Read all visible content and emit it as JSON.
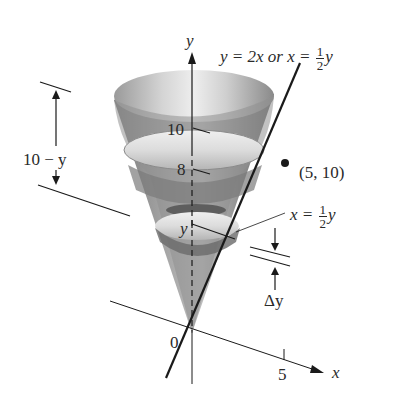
{
  "figure": {
    "type": "cone-volume-of-revolution",
    "axes": {
      "y_axis_label": "y",
      "x_axis_label": "x",
      "origin_label": "0",
      "x_tick_label": "5",
      "y_tick_labels": [
        "10",
        "8"
      ]
    },
    "line_equation": {
      "lhs": "y = 2x or x =",
      "frac_num": "1",
      "frac_den": "2",
      "rhs": "y"
    },
    "point_label": "(5, 10)",
    "radius_label": {
      "lhs": "x =",
      "frac_num": "1",
      "frac_den": "2",
      "rhs": "y"
    },
    "slice_height_label": "y",
    "delta_label": "Δy",
    "depth_label": "10 − y",
    "colors": {
      "line": "#1a1a1a",
      "cone_dark": "#6e6e6e",
      "cone_mid": "#9a9a9a",
      "cone_light": "#d6d6d6",
      "text": "#2a2a2a"
    }
  }
}
